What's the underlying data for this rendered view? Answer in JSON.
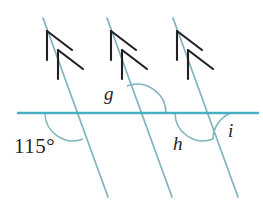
{
  "figure": {
    "type": "geometry-diagram",
    "background_color": "#ffffff"
  },
  "colors": {
    "horizontal_line": "#4aaec3",
    "parallel_lines": "#7fb3bd",
    "arrowhead": "#231f20",
    "arc": "#7fb3bd",
    "label_text": "#231f20"
  },
  "lines": {
    "horizontal": {
      "name": "horizontal-transversal",
      "x1": 18,
      "y1": 113,
      "x2": 258,
      "y2": 113,
      "stroke_width": 2.4
    },
    "parallels": [
      {
        "name": "parallel-line-1",
        "x1": 43,
        "y1": 18,
        "x2": 108,
        "y2": 197,
        "stroke_width": 1.7,
        "arrow_marks": 2
      },
      {
        "name": "parallel-line-2",
        "x1": 107,
        "y1": 18,
        "x2": 172,
        "y2": 197,
        "stroke_width": 1.7,
        "arrow_marks": 2
      },
      {
        "name": "parallel-line-3",
        "x1": 173,
        "y1": 18,
        "x2": 238,
        "y2": 197,
        "stroke_width": 1.7,
        "arrow_marks": 2
      }
    ]
  },
  "intersections": [
    {
      "name": "intersection-1",
      "x": 73,
      "y": 113
    },
    {
      "name": "intersection-2",
      "x": 137,
      "y": 113
    },
    {
      "name": "intersection-3",
      "x": 203,
      "y": 113
    }
  ],
  "angles": [
    {
      "id": "angle-115",
      "label": "115°",
      "value": 115,
      "unit": "degrees",
      "position": "below-left of intersection-1",
      "known": true
    },
    {
      "id": "angle-g",
      "label": "g",
      "value": null,
      "unit": "degrees",
      "position": "above-left of intersection-2",
      "known": false
    },
    {
      "id": "angle-h",
      "label": "h",
      "value": null,
      "unit": "degrees",
      "position": "below-left of intersection-3",
      "known": false
    },
    {
      "id": "angle-i",
      "label": "i",
      "value": null,
      "unit": "degrees",
      "position": "below-right of intersection-3",
      "known": false
    }
  ]
}
